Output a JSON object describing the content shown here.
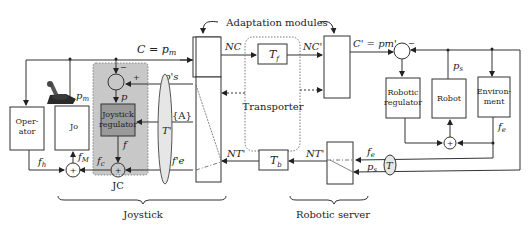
{
  "title": "Adaptation modules",
  "labels": {
    "c_eq": "C = p",
    "c_eq_sub": "m",
    "pm": "p",
    "pm_sub": "m",
    "nc": "NC",
    "nc_prime": "NC'",
    "c_prime_eq": "C' = pm'",
    "tf": "T",
    "tf_sub": "f",
    "tb": "T",
    "tb_sub": "b",
    "nt": "NT'",
    "nt_prime": "NT'",
    "ps_prime": "p's",
    "A": "{A}",
    "t_prime": "T'",
    "fe_prime": "f'e",
    "fh": "f",
    "fh_sub": "h",
    "fm": "f",
    "fm_sub": "M",
    "fc": "f",
    "fc_sub": "c",
    "f": "f",
    "p": "p",
    "ps": "p",
    "ps_sub": "s",
    "fe": "f",
    "fe_sub": "e",
    "T": "T",
    "plus": "+",
    "minus": "−"
  },
  "blocks": {
    "operator": [
      "Oper-",
      "ator"
    ],
    "jo": "Jo",
    "joystick_regulator": [
      "Joystick",
      "regulator"
    ],
    "jc": "JC",
    "transporter": "Transporter",
    "robotic_regulator": [
      "Robotic",
      "regulator"
    ],
    "robot": "Robot",
    "environment": [
      "Environ-",
      "ment"
    ]
  },
  "braces": {
    "joystick": "Joystick",
    "robotic_server": "Robotic server"
  },
  "colors": {
    "line": "#333333",
    "jc_fill": "#c8c8c8",
    "jreg_fill": "#9a9a9a",
    "ellipse_fill": "#e6e6e6"
  }
}
